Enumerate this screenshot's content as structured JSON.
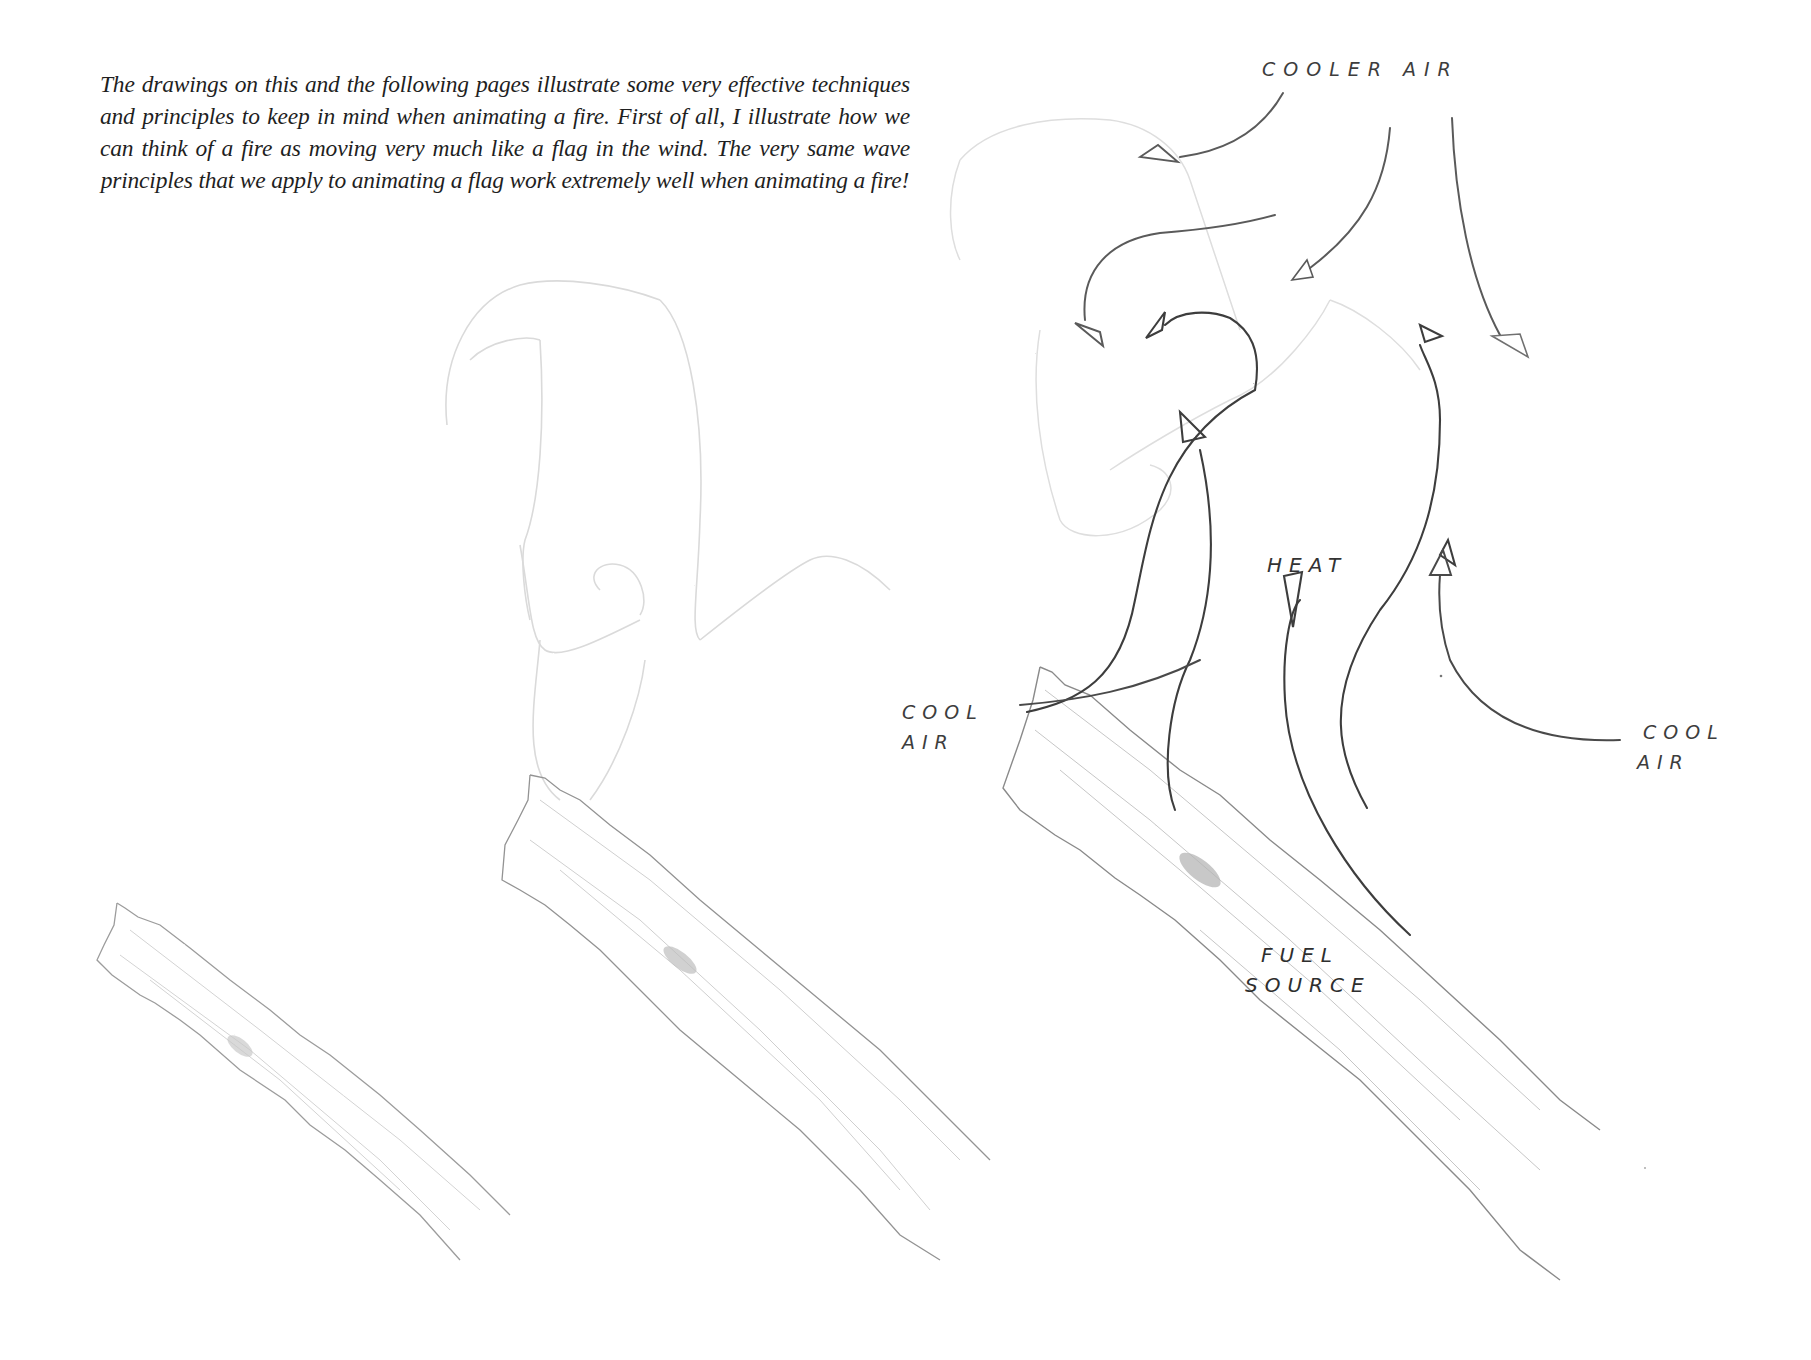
{
  "caption": {
    "text": "The drawings on this and the following pages illustrate some very effective techniques and principles to keep in mind when animating a fire. First of all, I illustrate how we can think of a fire as moving very much like a flag in the wind. The very same wave principles that we apply to animating a flag work extremely well when animating a fire!"
  },
  "labels": {
    "cooler_air": "COOLER AIR",
    "heat": "HEAT",
    "cool_air_left_line1": "COOL",
    "cool_air_left_line2": "AIR",
    "cool_air_right_line1": "COOL",
    "cool_air_right_line2": "AIR",
    "fuel_source_line1": "FUEL",
    "fuel_source_line2": "SOURCE"
  },
  "drawing": {
    "stroke_dark": "#4a4a4a",
    "stroke_faint": "#d6d6d6",
    "stroke_log": "#b8b8b8",
    "logs": [
      "log-left",
      "log-middle",
      "log-right"
    ],
    "arrows": {
      "cooler_air_downward": 5,
      "heat_upward": 5,
      "cool_air_inward": 2
    }
  }
}
